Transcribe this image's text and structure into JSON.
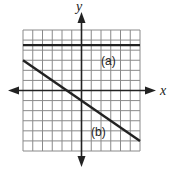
{
  "figure": {
    "type": "coordinate-plane",
    "grid": {
      "x_min": -6,
      "x_max": 6,
      "y_min": -6,
      "y_max": 6,
      "step": 1
    },
    "axes": {
      "x_label": "x",
      "y_label": "y"
    },
    "lines": [
      {
        "label": "(a)",
        "kind": "horizontal",
        "y": 4.5,
        "color": "#222222"
      },
      {
        "label": "(b)",
        "kind": "linear",
        "slope": -0.6667,
        "intercept": -1,
        "from": [
          -6,
          3
        ],
        "to": [
          6,
          -5
        ],
        "color": "#222222"
      }
    ]
  }
}
